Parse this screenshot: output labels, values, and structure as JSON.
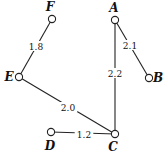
{
  "diagram": {
    "type": "weighted-graph",
    "nodes": [
      {
        "id": "F",
        "label": "F",
        "x": 52,
        "y": 19,
        "lx": 50,
        "ly": 11
      },
      {
        "id": "A",
        "label": "A",
        "x": 115,
        "y": 20,
        "lx": 114,
        "ly": 12
      },
      {
        "id": "B",
        "label": "B",
        "x": 149,
        "y": 78,
        "lx": 158,
        "ly": 82
      },
      {
        "id": "E",
        "label": "E",
        "x": 19,
        "y": 77,
        "lx": 9,
        "ly": 81
      },
      {
        "id": "D",
        "label": "D",
        "x": 51,
        "y": 132,
        "lx": 50,
        "ly": 150
      },
      {
        "id": "C",
        "label": "C",
        "x": 115,
        "y": 134,
        "lx": 113,
        "ly": 151
      }
    ],
    "edges": [
      {
        "from": "F",
        "to": "E",
        "weight": "1.8",
        "lx": 36,
        "ly": 47
      },
      {
        "from": "A",
        "to": "B",
        "weight": "2.1",
        "lx": 130,
        "ly": 46
      },
      {
        "from": "A",
        "to": "C",
        "weight": "2.2",
        "lx": 115,
        "ly": 74
      },
      {
        "from": "E",
        "to": "C",
        "weight": "2.0",
        "lx": 68,
        "ly": 108
      },
      {
        "from": "D",
        "to": "C",
        "weight": "1.2",
        "lx": 84,
        "ly": 135
      }
    ]
  }
}
